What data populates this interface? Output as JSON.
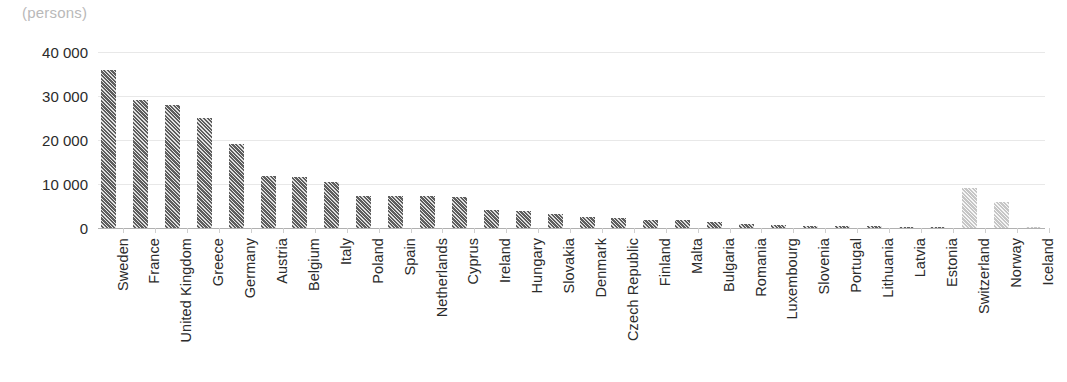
{
  "chart_data": {
    "type": "bar",
    "title": "",
    "unit_label": "(persons)",
    "xlabel": "",
    "ylabel": "",
    "ylim": [
      0,
      40000
    ],
    "grid": true,
    "legend": false,
    "ytick_labels": [
      "40 000",
      "30 000",
      "20 000",
      "10 000",
      "0"
    ],
    "ytick_values": [
      40000,
      30000,
      20000,
      10000,
      0
    ],
    "categories": [
      "Sweden",
      "France",
      "United Kingdom",
      "Greece",
      "Germany",
      "Austria",
      "Belgium",
      "Italy",
      "Poland",
      "Spain",
      "Netherlands",
      "Cyprus",
      "Ireland",
      "Hungary",
      "Slovakia",
      "Denmark",
      "Czech Republic",
      "Finland",
      "Malta",
      "Bulgaria",
      "Romania",
      "Luxembourg",
      "Slovenia",
      "Portugal",
      "Lithuania",
      "Latvia",
      "Estonia",
      "Switzerland",
      "Norway",
      "Iceland"
    ],
    "values": [
      36000,
      29200,
      28000,
      25100,
      19200,
      11900,
      11700,
      10400,
      7300,
      7300,
      7200,
      7000,
      4200,
      3800,
      3100,
      2600,
      2200,
      1900,
      1800,
      1300,
      1000,
      600,
      550,
      450,
      400,
      250,
      180,
      9000,
      5900,
      120
    ],
    "series_groups": [
      {
        "name": "EU Member States",
        "color": "#5e5e5e",
        "from": 0,
        "to": 26
      },
      {
        "name": "EFTA countries",
        "color": "#c6c6c6",
        "from": 27,
        "to": 29
      }
    ]
  }
}
